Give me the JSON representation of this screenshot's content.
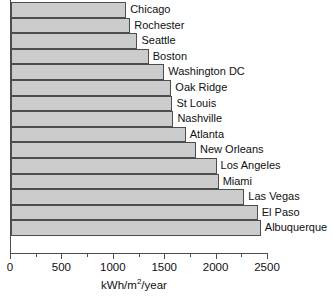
{
  "chart_data": {
    "type": "bar",
    "orientation": "horizontal",
    "title": "",
    "xlabel": "kWh/m2/year",
    "xlabel_parts": {
      "pre": "kWh/m",
      "sup": "2",
      "post": "/year"
    },
    "ylabel": "",
    "xlim": [
      0,
      2500
    ],
    "grid": false,
    "legend": null,
    "xticks": [
      0,
      500,
      1000,
      1500,
      2000,
      2500
    ],
    "xtick_labels": [
      "0",
      "500",
      "1000",
      "1500",
      "2000",
      "2500"
    ],
    "xminor_ticks": [
      250,
      750,
      1250,
      1750,
      2250
    ],
    "categories": [
      "Chicago",
      "Rochester",
      "Seattle",
      "Boston",
      "Washington DC",
      "Oak Ridge",
      "St Louis",
      "Nashville",
      "Atlanta",
      "New Orleans",
      "Los Angeles",
      "Miami",
      "Las Vegas",
      "El Paso",
      "Albuquerque"
    ],
    "values": [
      1120,
      1160,
      1230,
      1340,
      1490,
      1560,
      1570,
      1580,
      1700,
      1800,
      2000,
      2020,
      2270,
      2400,
      2430
    ],
    "bar_fill": "#cccccc",
    "bar_edge": "#4d4d4d",
    "axis_color": "#4d4d4d"
  }
}
